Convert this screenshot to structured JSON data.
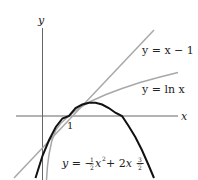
{
  "diagram": {
    "axes": {
      "x_label": "x",
      "y_label": "y",
      "tick_label_1": "1"
    },
    "curves": [
      {
        "name": "tangent-line",
        "label": "y = x − 1",
        "color": "#a8a8a8"
      },
      {
        "name": "ln-curve",
        "label": "y = ln x",
        "color": "#a8a8a8"
      },
      {
        "name": "parabola",
        "label_parts": [
          "y = −",
          "1",
          "2",
          "x",
          "2",
          " + 2x − ",
          "3",
          "2"
        ],
        "color": "#111111"
      }
    ],
    "colors": {
      "axis": "#666666",
      "light_curve": "#a8a8a8",
      "dark_curve": "#111111"
    }
  }
}
